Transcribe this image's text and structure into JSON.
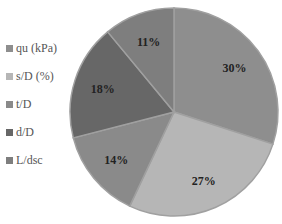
{
  "chart_data": {
    "type": "pie",
    "title": "",
    "categories": [
      "qu (kPa)",
      "s/D (%)",
      "t/D",
      "d/D",
      "L/dsc"
    ],
    "values": [
      30,
      27,
      14,
      18,
      11
    ],
    "labels": [
      "30%",
      "27%",
      "14%",
      "18%",
      "11%"
    ],
    "colors": [
      "#8e8e8e",
      "#b6b6b6",
      "#8a8a8a",
      "#676767",
      "#7e7e7e"
    ],
    "start_angle": "12 o'clock",
    "direction": "clockwise",
    "legend_position": "left"
  },
  "legend": {
    "items": [
      {
        "label": "qu (kPa)",
        "color": "#8e8e8e"
      },
      {
        "label": "s/D (%)",
        "color": "#b6b6b6"
      },
      {
        "label": "t/D",
        "color": "#8a8a8a"
      },
      {
        "label": "d/D",
        "color": "#676767"
      },
      {
        "label": "L/dsc",
        "color": "#7e7e7e"
      }
    ]
  }
}
